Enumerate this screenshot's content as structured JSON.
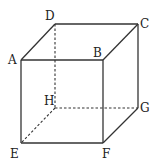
{
  "diagram": {
    "type": "cube",
    "vertices": {
      "A": {
        "x": 21,
        "y": 60,
        "label": "A",
        "lx": 8,
        "ly": 64
      },
      "B": {
        "x": 103,
        "y": 60,
        "label": "B",
        "lx": 94,
        "ly": 57
      },
      "C": {
        "x": 138,
        "y": 24,
        "label": "C",
        "lx": 140,
        "ly": 28
      },
      "D": {
        "x": 55,
        "y": 24,
        "label": "D",
        "lx": 45,
        "ly": 20
      },
      "E": {
        "x": 21,
        "y": 143,
        "label": "E",
        "lx": 10,
        "ly": 158
      },
      "F": {
        "x": 103,
        "y": 143,
        "label": "F",
        "lx": 102,
        "ly": 158
      },
      "G": {
        "x": 138,
        "y": 108,
        "label": "G",
        "lx": 140,
        "ly": 112
      },
      "H": {
        "x": 55,
        "y": 108,
        "label": "H",
        "lx": 44,
        "ly": 105
      }
    },
    "visible_edges": [
      "AB",
      "BC",
      "CD",
      "DA",
      "AE",
      "BF",
      "CG",
      "EF",
      "FG"
    ],
    "hidden_edges": [
      "DH",
      "HE",
      "HG"
    ]
  }
}
